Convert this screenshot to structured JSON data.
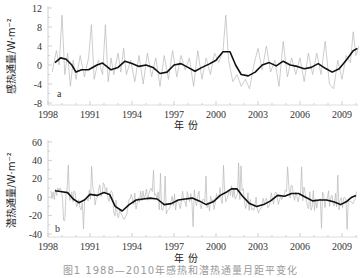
{
  "figure": {
    "caption": "图1  1988—2010年感热和潜热通量月距平变化"
  },
  "colors": {
    "raw_series": "#b8b8b8",
    "smoothed_series": "#111111",
    "axis": "#cfcfcf",
    "tick": "#cfcfcf"
  },
  "chart_data": [
    {
      "type": "line",
      "panel": "a",
      "title": "",
      "xlabel": "年 份",
      "ylabel": "感热通量/W·m⁻²",
      "xlim": [
        1988.0,
        2010.5
      ],
      "ylim": [
        -8,
        12
      ],
      "yticks": [
        12,
        8,
        4,
        0,
        -4,
        -8
      ],
      "xtick_labels": [
        "1998",
        "1991",
        "1994",
        "1997",
        "2000",
        "2003",
        "2006",
        "2009"
      ],
      "xtick_values": [
        1988,
        1991,
        1994,
        1997,
        2000,
        2003,
        2006,
        2009
      ],
      "grid": false,
      "series": [
        {
          "name": "smoothed",
          "x": [
            1988.5,
            1988.9,
            1989.3,
            1989.7,
            1990.0,
            1990.4,
            1990.9,
            1991.5,
            1991.9,
            1992.5,
            1993.0,
            1993.5,
            1994.0,
            1994.5,
            1995.0,
            1995.5,
            1996.0,
            1996.5,
            1997.0,
            1997.5,
            1998.0,
            1998.5,
            1999.0,
            1999.5,
            2000.0,
            2000.5,
            2001.0,
            2001.4,
            2001.8,
            2002.3,
            2002.8,
            2003.3,
            2003.8,
            2004.3,
            2004.8,
            2005.3,
            2005.8,
            2006.3,
            2006.8,
            2007.3,
            2007.8,
            2008.3,
            2008.8,
            2009.3,
            2009.8,
            2010.1
          ],
          "values": [
            0.5,
            1.5,
            1.2,
            0.0,
            -1.5,
            -1.0,
            -1.0,
            0.0,
            0.4,
            -1.0,
            -0.5,
            0.8,
            0.3,
            -0.3,
            0.0,
            -0.5,
            -1.8,
            -1.5,
            0.0,
            0.3,
            -0.5,
            -1.3,
            -0.5,
            0.2,
            1.0,
            2.8,
            2.8,
            0.0,
            -2.0,
            -2.3,
            -1.5,
            0.0,
            0.5,
            -0.2,
            0.8,
            0.0,
            -0.3,
            -0.8,
            -0.5,
            0.3,
            -0.7,
            -1.5,
            -0.8,
            1.0,
            3.0,
            3.5
          ]
        },
        {
          "name": "monthly",
          "x": [
            1988.3,
            1988.6,
            1988.8,
            1989.0,
            1989.2,
            1989.4,
            1989.6,
            1989.8,
            1990.0,
            1990.3,
            1990.6,
            1990.9,
            1991.1,
            1991.3,
            1991.6,
            1991.9,
            1992.1,
            1992.3,
            1992.5,
            1992.7,
            1993.0,
            1993.2,
            1993.4,
            1993.6,
            1993.9,
            1994.2,
            1994.5,
            1994.8,
            1995.1,
            1995.4,
            1995.7,
            1996.0,
            1996.3,
            1996.6,
            1996.9,
            1997.2,
            1997.5,
            1997.8,
            1998.1,
            1998.4,
            1998.7,
            1999.0,
            1999.3,
            1999.6,
            1999.9,
            2000.2,
            2000.5,
            2000.7,
            2000.9,
            2001.2,
            2001.5,
            2001.8,
            2002.1,
            2002.4,
            2002.7,
            2003.0,
            2003.3,
            2003.6,
            2003.9,
            2004.2,
            2004.5,
            2004.8,
            2005.1,
            2005.4,
            2005.7,
            2006.0,
            2006.3,
            2006.6,
            2006.9,
            2007.2,
            2007.5,
            2007.8,
            2008.1,
            2008.4,
            2008.7,
            2009.0,
            2009.3,
            2009.6,
            2009.8,
            2010.0,
            2010.2
          ],
          "values": [
            -1.5,
            3.0,
            0.0,
            10.5,
            -2.0,
            2.5,
            -4.5,
            1.0,
            -3.0,
            2.0,
            -2.5,
            1.5,
            8.5,
            -3.0,
            1.0,
            -2.0,
            8.5,
            -3.5,
            1.5,
            -2.0,
            2.5,
            -1.5,
            3.5,
            -2.0,
            1.0,
            -3.5,
            2.0,
            -4.0,
            2.5,
            -2.5,
            1.5,
            -4.5,
            2.0,
            -3.0,
            3.0,
            -2.5,
            2.0,
            -1.0,
            1.5,
            -4.5,
            3.0,
            -3.0,
            1.5,
            -2.0,
            2.5,
            0.5,
            3.0,
            10.5,
            1.0,
            -3.5,
            -2.0,
            -4.5,
            -3.0,
            -5.0,
            0.0,
            3.5,
            -1.0,
            4.0,
            -1.5,
            1.0,
            -4.5,
            5.0,
            -2.5,
            1.5,
            -2.0,
            1.5,
            -3.5,
            2.5,
            -2.0,
            2.5,
            -2.0,
            5.0,
            -4.0,
            -5.0,
            1.0,
            -3.0,
            2.0,
            0.5,
            7.0,
            2.0,
            4.0
          ]
        }
      ]
    },
    {
      "type": "line",
      "panel": "b",
      "title": "",
      "xlabel": "年 份",
      "ylabel": "潜热通量/W·m⁻²",
      "xlim": [
        1988.0,
        2010.5
      ],
      "ylim": [
        -40,
        60
      ],
      "yticks": [
        60,
        40,
        20,
        0,
        -20,
        -40
      ],
      "xtick_labels": [
        "1998",
        "1991",
        "1994",
        "1997",
        "2000",
        "2003",
        "2006",
        "2009"
      ],
      "xtick_values": [
        1988,
        1991,
        1994,
        1997,
        2000,
        2003,
        2006,
        2009
      ],
      "grid": false,
      "series": [
        {
          "name": "smoothed",
          "x": [
            1988.5,
            1989.0,
            1989.4,
            1989.8,
            1990.2,
            1990.6,
            1991.0,
            1991.5,
            1992.0,
            1992.4,
            1992.8,
            1993.3,
            1993.8,
            1994.3,
            1994.8,
            1995.3,
            1995.8,
            1996.3,
            1996.8,
            1997.3,
            1997.8,
            1998.3,
            1998.8,
            1999.3,
            1999.8,
            2000.3,
            2000.8,
            2001.1,
            2001.5,
            2001.9,
            2002.4,
            2002.9,
            2003.4,
            2003.9,
            2004.4,
            2004.9,
            2005.4,
            2005.9,
            2006.4,
            2006.9,
            2007.4,
            2007.9,
            2008.4,
            2008.9,
            2009.3,
            2009.7,
            2010.0
          ],
          "values": [
            7,
            6,
            5,
            -2,
            -6,
            -3,
            3,
            2,
            5,
            3,
            -10,
            -15,
            -8,
            -3,
            -2,
            -1,
            -2,
            -8,
            -7,
            -3,
            -2,
            -1,
            -4,
            -8,
            -5,
            2,
            6,
            9,
            9,
            1,
            -7,
            -10,
            -8,
            -4,
            2,
            1,
            4,
            4,
            0,
            -4,
            -3,
            -3,
            -5,
            -8,
            -5,
            0,
            2,
            -2,
            -4,
            -1,
            3,
            5,
            -1,
            -3,
            -4,
            -3,
            3,
            12,
            22
          ]
        }
      ]
    }
  ],
  "panels": {
    "a": {
      "tag": "a",
      "ylabel": "感热通量/W·m⁻²",
      "xlabel": "年 份",
      "yticks": [
        "12",
        "8",
        "4",
        "0",
        "-4",
        "-8"
      ],
      "xticks": [
        "1998",
        "1991",
        "1994",
        "1997",
        "2000",
        "2003",
        "2006",
        "2009"
      ]
    },
    "b": {
      "tag": "b",
      "ylabel": "潜热通量/W·m⁻²",
      "xlabel": "年 份",
      "yticks": [
        "60",
        "40",
        "20",
        "0",
        "-20",
        "-40"
      ],
      "xticks": [
        "1998",
        "1991",
        "1994",
        "1997",
        "2000",
        "2003",
        "2006",
        "2009"
      ]
    }
  }
}
